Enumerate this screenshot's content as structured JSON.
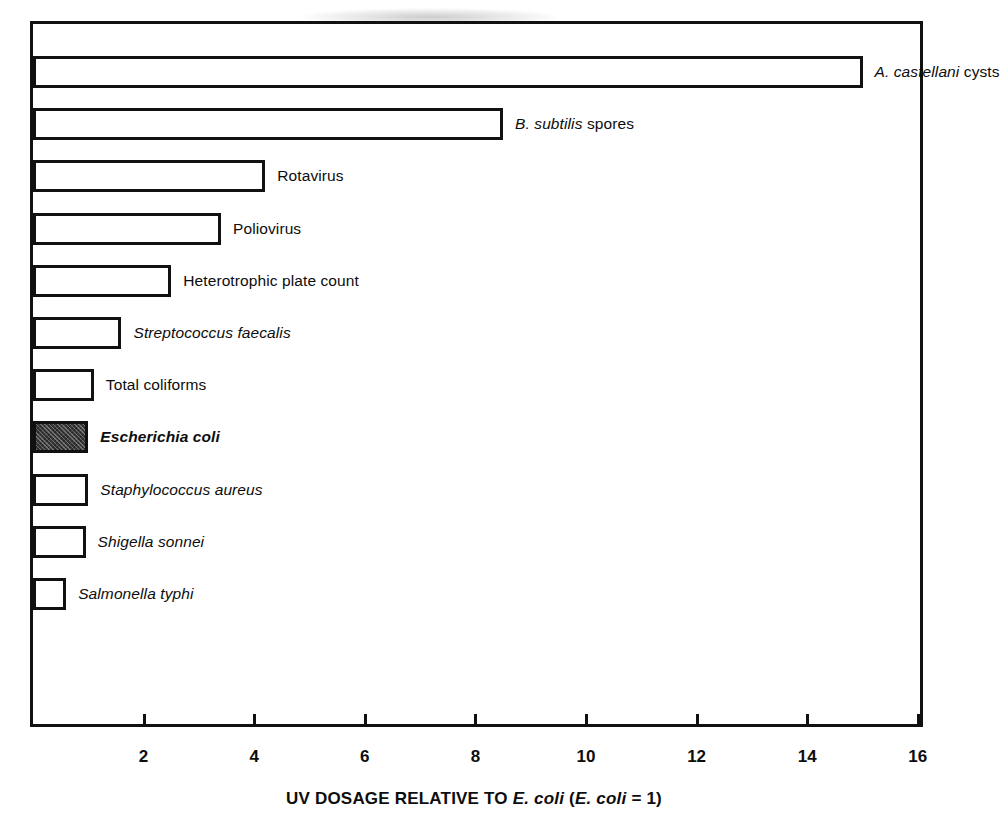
{
  "chart_data": {
    "type": "bar",
    "orientation": "horizontal",
    "title": "",
    "xlabel": "UV DOSAGE RELATIVE TO E. coli  (E. coli = 1)",
    "ylabel": "",
    "xlim": [
      0,
      16
    ],
    "xticks": [
      2,
      4,
      6,
      8,
      10,
      12,
      14,
      16
    ],
    "xtick_labels": [
      "2",
      "4",
      "6",
      "8",
      "10",
      "12",
      "14",
      "16"
    ],
    "grid": false,
    "legend": "none",
    "categories": [
      "A. castellani cysts",
      "B. subtilis spores",
      "Rotavirus",
      "Poliovirus",
      "Heterotrophic plate count",
      "Streptococcus faecalis",
      "Total coliforms",
      "Escherichia coli",
      "Staphylococcus aureus",
      "Shigella sonnei",
      "Salmonella typhi"
    ],
    "values": [
      15.0,
      8.5,
      4.2,
      3.4,
      2.5,
      1.6,
      1.1,
      1.0,
      1.0,
      0.95,
      0.6
    ],
    "highlight_category": "Escherichia coli",
    "bar_fill": "#ffffff",
    "bar_edge": "#111111",
    "highlight_fill": "#3a3a3a"
  },
  "axis": {
    "title_prefix": "UV DOSAGE RELATIVE TO ",
    "title_italic_1": "E. coli",
    "title_mid": "  (",
    "title_italic_2": "E. coli",
    "title_suffix": " = 1)",
    "ticks": [
      {
        "value": 2,
        "label": "2"
      },
      {
        "value": 4,
        "label": "4"
      },
      {
        "value": 6,
        "label": "6"
      },
      {
        "value": 8,
        "label": "8"
      },
      {
        "value": 10,
        "label": "10"
      },
      {
        "value": 12,
        "label": "12"
      },
      {
        "value": 14,
        "label": "14"
      },
      {
        "value": 16,
        "label": "16"
      }
    ]
  },
  "bars": [
    {
      "key": "a-castellani-cysts",
      "value": 15.0,
      "filled": false,
      "bold": false,
      "parts": [
        {
          "text": "A. castellani",
          "style": "italic"
        },
        {
          "text": " cysts",
          "style": "normal"
        }
      ]
    },
    {
      "key": "b-subtilis-spores",
      "value": 8.5,
      "filled": false,
      "bold": false,
      "parts": [
        {
          "text": "B. subtilis",
          "style": "italic"
        },
        {
          "text": " spores",
          "style": "normal"
        }
      ]
    },
    {
      "key": "rotavirus",
      "value": 4.2,
      "filled": false,
      "bold": false,
      "parts": [
        {
          "text": "Rotavirus",
          "style": "normal"
        }
      ]
    },
    {
      "key": "poliovirus",
      "value": 3.4,
      "filled": false,
      "bold": false,
      "parts": [
        {
          "text": "Poliovirus",
          "style": "normal"
        }
      ]
    },
    {
      "key": "heterotrophic-plate-count",
      "value": 2.5,
      "filled": false,
      "bold": false,
      "parts": [
        {
          "text": "Heterotrophic plate count",
          "style": "normal"
        }
      ]
    },
    {
      "key": "streptococcus-faecalis",
      "value": 1.6,
      "filled": false,
      "bold": false,
      "parts": [
        {
          "text": "Streptococcus faecalis",
          "style": "italic"
        }
      ]
    },
    {
      "key": "total-coliforms",
      "value": 1.1,
      "filled": false,
      "bold": false,
      "parts": [
        {
          "text": "Total coliforms",
          "style": "normal"
        }
      ]
    },
    {
      "key": "escherichia-coli",
      "value": 1.0,
      "filled": true,
      "bold": true,
      "parts": [
        {
          "text": "Escherichia coli",
          "style": "bold-italic"
        }
      ]
    },
    {
      "key": "staphylococcus-aureus",
      "value": 1.0,
      "filled": false,
      "bold": false,
      "parts": [
        {
          "text": "Staphylococcus aureus",
          "style": "italic"
        }
      ]
    },
    {
      "key": "shigella-sonnei",
      "value": 0.95,
      "filled": false,
      "bold": false,
      "parts": [
        {
          "text": "Shigella sonnei",
          "style": "italic"
        }
      ]
    },
    {
      "key": "salmonella-typhi",
      "value": 0.6,
      "filled": false,
      "bold": false,
      "parts": [
        {
          "text": "Salmonella typhi",
          "style": "italic"
        }
      ]
    }
  ],
  "geometry": {
    "x0_px": 33,
    "px_per_unit": 55.3,
    "first_bar_center_y": 72,
    "bar_spacing_y": 52.2,
    "bar_height": 32,
    "label_gap_px": 12
  }
}
